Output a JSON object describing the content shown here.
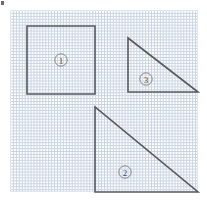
{
  "canvas": {
    "width": 207,
    "height": 201,
    "background_color": "#ffffff"
  },
  "grid": {
    "name": "dotted-coordinate-grid",
    "left": 10,
    "top": 10,
    "width": 188,
    "height": 182,
    "cell_size_px": 23.5,
    "columns": 8,
    "rows": 8,
    "line_color": "#b9c6d8",
    "style": "dotted",
    "border_color": "#dfe6ee"
  },
  "corner_mark": {
    "name": "corner-tick-mark",
    "color": "#6b6b6b",
    "x": 1,
    "y": 1,
    "width": 3,
    "height": 4
  },
  "figures": [
    {
      "id": "figure-1",
      "label": "①",
      "label_number": "1",
      "shape": "square",
      "stroke_color": "#59595b",
      "points": "27,26 95,26 95,94 27,94",
      "label_x": 61,
      "label_y": 60,
      "label_radius": 6.2,
      "grid_cells_wide": 3,
      "grid_cells_tall": 3
    },
    {
      "id": "figure-3",
      "label": "③",
      "label_number": "3",
      "shape": "right-triangle",
      "stroke_color": "#59595b",
      "points": "128,38 128,92 198,92",
      "label_x": 146,
      "label_y": 79,
      "label_radius": 6.2,
      "right_angle_at": "bottom-left",
      "grid_cells_wide": 3,
      "grid_cells_tall": 2.3
    },
    {
      "id": "figure-2",
      "label": "②",
      "label_number": "2",
      "shape": "right-triangle",
      "stroke_color": "#59595b",
      "points": "95,107 95,192 198,192",
      "label_x": 125,
      "label_y": 172,
      "label_radius": 6.2,
      "right_angle_at": "bottom-left",
      "grid_cells_wide": 4.4,
      "grid_cells_tall": 3.6
    }
  ]
}
